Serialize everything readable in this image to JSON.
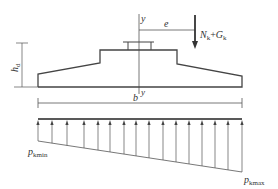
{
  "diagram": {
    "labels": {
      "axis_top": "y",
      "axis_bottom": "y",
      "eccentricity": "e",
      "load_N": "N",
      "load_N_sub": "k",
      "load_plus": "+",
      "load_G": "G",
      "load_G_sub": "k",
      "height": "h",
      "height_sub": "d",
      "width": "b",
      "p_min": "p",
      "p_min_sub": "kmin",
      "p_max": "p",
      "p_max_sub": "kmax"
    },
    "colors": {
      "line": "#444444",
      "text": "#333333",
      "background": "#ffffff"
    }
  }
}
